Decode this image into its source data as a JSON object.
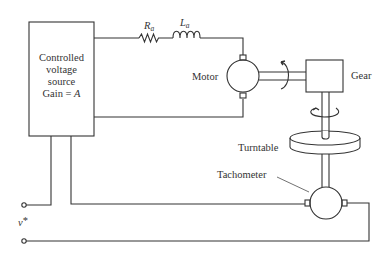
{
  "diagram": {
    "source_box": {
      "line1": "Controlled",
      "line2": "voltage",
      "line3": "source",
      "line4_prefix": "Gain = ",
      "line4_var": "A"
    },
    "resistor": {
      "symbol": "R",
      "subscript": "a"
    },
    "inductor": {
      "symbol": "L",
      "subscript": "a"
    },
    "motor_label": "Motor",
    "gear_label": "Gear",
    "turntable_label": "Turntable",
    "tachometer_label": "Tachometer",
    "input_label": {
      "symbol": "v",
      "superscript": "*"
    },
    "colors": {
      "line": "#333333",
      "background": "#ffffff"
    }
  }
}
